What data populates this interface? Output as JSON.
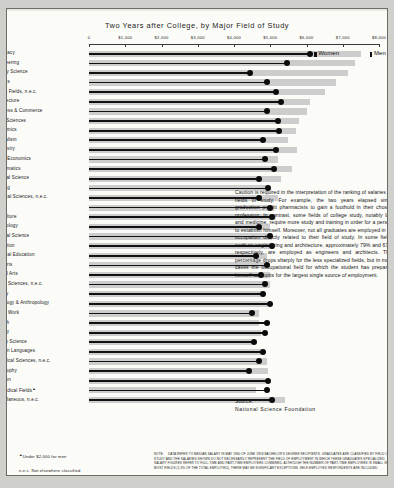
{
  "chart_data": {
    "type": "bar",
    "title": "Two Years after College, by Major Field of Study",
    "xlabel": "",
    "ylabel": "",
    "xlim": [
      0,
      8000
    ],
    "xticks": [
      0,
      1000,
      2000,
      3000,
      4000,
      5000,
      6000,
      7000,
      8000
    ],
    "xtick_labels": [
      "0",
      "$1,000",
      "$2,000",
      "$3,000",
      "$4,000",
      "$5,000",
      "$6,000",
      "$7,000",
      "$8,000"
    ],
    "grid": false,
    "legend_position": "top-right",
    "series": [
      {
        "name": "Men",
        "marker": "gray-bar",
        "color": "#cdcdcd"
      },
      {
        "name": "Women",
        "marker": "black-line-dot",
        "color": "#111111"
      }
    ],
    "categories": [
      "Pharmacy",
      "Engineering",
      "Military Science",
      "Physics",
      "Health Fields, n.e.c.",
      "Architecture",
      "Business & Commerce",
      "Earth Sciences",
      "Economics",
      "Journalism",
      "Chemistry",
      "Home Economics",
      "Mathematics",
      "Political Science",
      "Nursing",
      "Physical Sciences, n.e.c.",
      "Law",
      "Agriculture",
      "Psychology",
      "General Science",
      "Education",
      "Physical Education",
      "Fine Arts",
      "Liberal Arts",
      "Social Sciences, n.e.c.",
      "History",
      "Sociology & Anthropology",
      "Social Work",
      "English",
      "Biology",
      "Library Science",
      "Foreign Languages",
      "Biological Sciences, n.e.c.",
      "Philosophy",
      "Religion",
      "Premedical Fields",
      "Miscellaneous, n.e.c."
    ],
    "category_footnote_marks": {
      "Premedical Fields": "▲"
    },
    "values_men": [
      7500,
      7350,
      7150,
      6800,
      6500,
      6100,
      6000,
      5800,
      5700,
      5500,
      5750,
      5200,
      5600,
      5300,
      5000,
      5200,
      5100,
      5150,
      5000,
      5050,
      5100,
      4900,
      4850,
      5000,
      5000,
      4800,
      4900,
      4700,
      4700,
      4750,
      4500,
      4800,
      4900,
      4950,
      4850,
      4600,
      5400
    ],
    "values_women": [
      6100,
      5450,
      4450,
      4900,
      5150,
      5300,
      4900,
      5200,
      5250,
      4800,
      5150,
      4850,
      5100,
      4700,
      4950,
      4700,
      5000,
      5050,
      4700,
      5000,
      5050,
      4600,
      4900,
      4750,
      4850,
      4800,
      5000,
      4500,
      4900,
      4850,
      4550,
      4800,
      4700,
      4400,
      4950,
      4900,
      5050
    ]
  },
  "legend": {
    "women_label": "Women",
    "men_label": "Men"
  },
  "caution": {
    "text": "Caution is required in the interpretation of the ranking of salaries by fields of study. For example, the two years elapsed since graduation permit pharmacists to gain a foothold in their chosen profession. In contrast, some fields of college study, notably law and medicine, require more study and training in order for a person to establish himself. Moreover, not all graduates are employed in an occupation directly related to their field of study. In some fields such as engineering and architecture, approximately 79% and 67% respectively, are employed as engineers and architects. This percentage drops sharply for the less specialized fields, but in most cases the occupational field for which the student has prepared himself accounts for the largest single source of employment."
  },
  "source": {
    "label": "Source:",
    "value": "National Science Foundation"
  },
  "footnotes": {
    "dagger_mark": "▲",
    "footnote_1": "Under $2,000 for men",
    "footnote_2": "n.e.c. Not elsewhere classified"
  },
  "bottom_note": {
    "keyword": "NOTE:",
    "text": "DATA REFER TO MEDIAN SALARY IN MAY 1960 OF JUNE 1958 BACHELOR'S DEGREE RECIPIENTS. GRADUATES ARE CLASSIFIED BY FIELD OF STUDY AND THE SALARIES SHOWN DO NOT NECESSARILY REPRESENT THE FIELD OF EMPLOYMENT IN WHICH THESE GRADUATES SPECIALIZED. SALARY FIGURES REFER TO FULL-TIME AND PART-TIME EMPLOYEES COMBINED. ALTHOUGH THE NUMBER OF PART-TIME EMPLOYEES IS SMALL IN MOST FIELDS (1.3% OF THE TOTAL EMPLOYED), THERE MAY BE SIGNIFICANT EXCEPTIONS. SELF-EMPLOYED RESPONDENTS ARE INCLUDED."
  }
}
